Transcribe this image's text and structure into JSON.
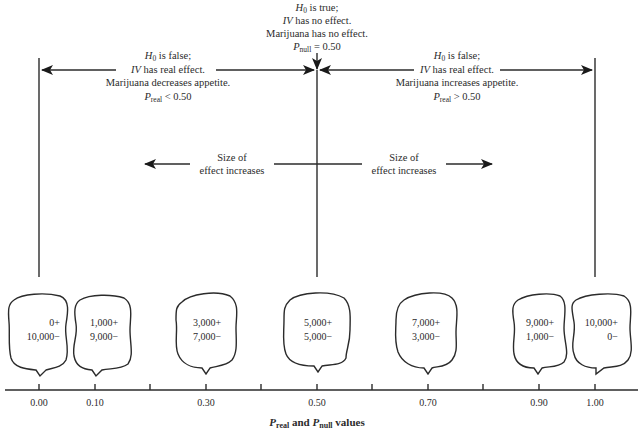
{
  "figure": {
    "type": "hypothesis-testing-diagram",
    "center_annotation": {
      "line1_symbol": "H",
      "line1_sub": "0",
      "line1_rest": " is true;",
      "line2_italic": "IV",
      "line2_rest": " has no effect.",
      "line3": "Marijuana has no effect.",
      "line4_symbol": "P",
      "line4_sub": "null",
      "line4_rest": " = 0.50"
    },
    "left_annotation": {
      "line1_symbol": "H",
      "line1_sub": "0",
      "line1_rest": " is false;",
      "line2_italic": "IV",
      "line2_rest": " has real effect.",
      "line3": "Marijuana decreases appetite.",
      "line4_symbol": "P",
      "line4_sub": "real",
      "line4_rest": " < 0.50"
    },
    "right_annotation": {
      "line1_symbol": "H",
      "line1_sub": "0",
      "line1_rest": " is false;",
      "line2_italic": "IV",
      "line2_rest": " has real effect.",
      "line3": "Marijuana increases appetite.",
      "line4_symbol": "P",
      "line4_sub": "real",
      "line4_rest": " > 0.50"
    },
    "effect_size_left": {
      "line1": "Size of",
      "line2": "effect increases"
    },
    "effect_size_right": {
      "line1": "Size of",
      "line2": "effect increases"
    },
    "bubbles": [
      {
        "position": "0.00",
        "plus": "0+",
        "minus": "10,000−"
      },
      {
        "position": "0.10",
        "plus": "1,000+",
        "minus": "9,000−"
      },
      {
        "position": "0.30",
        "plus": "3,000+",
        "minus": "7,000−"
      },
      {
        "position": "0.50",
        "plus": "5,000+",
        "minus": "5,000−"
      },
      {
        "position": "0.70",
        "plus": "7,000+",
        "minus": "3,000−"
      },
      {
        "position": "0.90",
        "plus": "9,000+",
        "minus": "1,000−"
      },
      {
        "position": "1.00",
        "plus": "10,000+",
        "minus": "0−"
      }
    ],
    "axis": {
      "tick_labels": [
        "0.00",
        "0.10",
        "0.30",
        "0.50",
        "0.70",
        "0.90",
        "1.00"
      ],
      "title_p1": "P",
      "title_sub1": "real",
      "title_mid": " and ",
      "title_p2": "P",
      "title_sub2": "null",
      "title_rest": " values"
    }
  }
}
